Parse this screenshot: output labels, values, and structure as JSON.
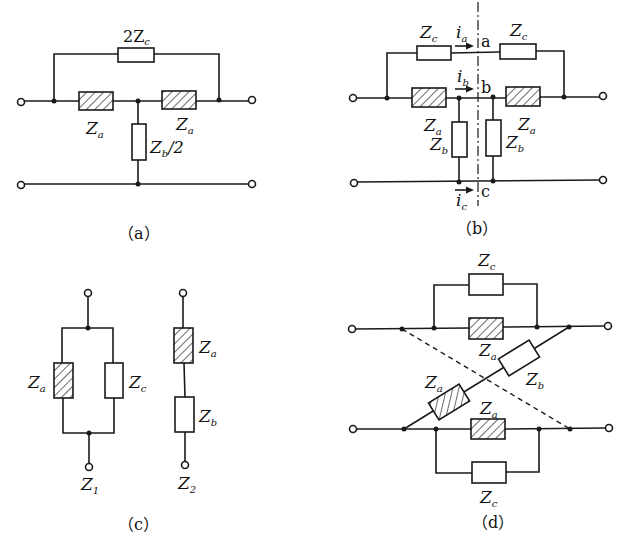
{
  "figure": {
    "panels": [
      {
        "id": "a",
        "caption": "（a）",
        "labels": {
          "top": "2Z",
          "top_sub": "c",
          "left": "Z",
          "left_sub": "a",
          "right": "Z",
          "right_sub": "a",
          "shunt": "Z",
          "shunt_sub": "b",
          "shunt_suffix": "/2"
        }
      },
      {
        "id": "b",
        "caption": "（b）",
        "labels": {
          "zc_left": "Z",
          "zc_left_sub": "c",
          "zc_right": "Z",
          "zc_right_sub": "c",
          "za_left": "Z",
          "za_left_sub": "a",
          "za_right": "Z",
          "za_right_sub": "a",
          "zb_left": "Z",
          "zb_left_sub": "b",
          "zb_right": "Z",
          "zb_right_sub": "b",
          "ia": "i",
          "ia_sub": "a",
          "ib": "i",
          "ib_sub": "b",
          "ic": "i",
          "ic_sub": "c",
          "node_a": "a",
          "node_b": "b",
          "node_c": "c"
        }
      },
      {
        "id": "c",
        "caption": "（c）",
        "labels": {
          "za1": "Z",
          "za1_sub": "a",
          "zc1": "Z",
          "zc1_sub": "c",
          "z1": "Z",
          "z1_sub": "1",
          "za2": "Z",
          "za2_sub": "a",
          "zb2": "Z",
          "zb2_sub": "b",
          "z2": "Z",
          "z2_sub": "2"
        }
      },
      {
        "id": "d",
        "caption": "（d）",
        "labels": {
          "zc_top": "Z",
          "zc_top_sub": "c",
          "za_top": "Z",
          "za_top_sub": "a",
          "zb_diag": "Z",
          "zb_diag_sub": "b",
          "za_diag": "Z",
          "za_diag_sub": "a",
          "za_bottom": "Z",
          "za_bottom_sub": "a",
          "zc_bottom": "Z",
          "zc_bottom_sub": "c"
        }
      }
    ]
  }
}
